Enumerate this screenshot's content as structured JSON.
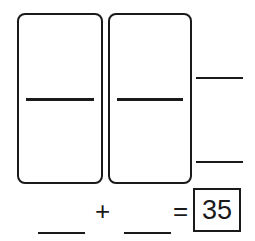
{
  "worksheet": {
    "dominoes": [
      {
        "top_value": "",
        "bottom_value": ""
      },
      {
        "top_value": "",
        "bottom_value": ""
      }
    ],
    "right_blanks": [
      "",
      ""
    ],
    "equation": {
      "addend1": "",
      "plus": "+",
      "addend2": "",
      "equals": "=",
      "sum": "35"
    }
  }
}
